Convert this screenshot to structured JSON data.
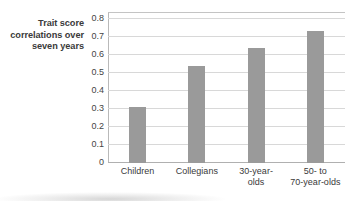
{
  "chart_data": {
    "type": "bar",
    "title": "",
    "xlabel": "",
    "ylabel": "Trait score correlations over seven years",
    "ylabel_lines": [
      "Trait score",
      "correlations over",
      "seven years"
    ],
    "categories": [
      "Children",
      "Collegians",
      "30-year-\nolds",
      "50-  to\n70-year-olds"
    ],
    "categories_plain": [
      "Children",
      "Collegians",
      "30-year-olds",
      "50- to 70-year-olds"
    ],
    "values": [
      0.31,
      0.54,
      0.64,
      0.735
    ],
    "ylim": [
      0,
      0.84
    ],
    "ytick_values": [
      0,
      0.1,
      0.2,
      0.3,
      0.4,
      0.5,
      0.6,
      0.7,
      0.8
    ],
    "ytick_labels": [
      "0",
      "0.1",
      "0.2",
      "0.3",
      "0.4",
      "0.5",
      "0.6",
      "0.7",
      "0.8"
    ],
    "grid": true,
    "legend": "none",
    "bar_color": "#9a9a9a",
    "gridline_color": "#d8d8d8",
    "axis_color": "#b9b9b9",
    "background": "#ffffff"
  }
}
